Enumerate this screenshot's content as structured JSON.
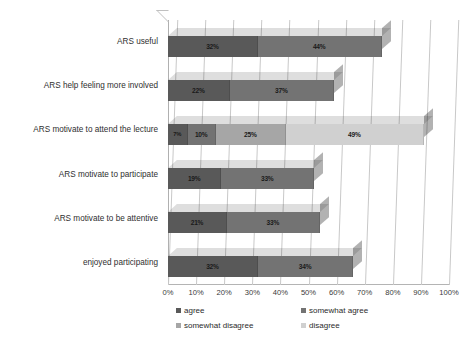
{
  "chart_data": {
    "type": "bar",
    "subtype": "horizontal-stacked-3d",
    "title": "",
    "xlabel": "",
    "ylabel": "",
    "xlim": [
      0,
      100
    ],
    "xtick_labels": [
      "0%",
      "10%",
      "20%",
      "30%",
      "40%",
      "50%",
      "60%",
      "70%",
      "80%",
      "90%",
      "100%"
    ],
    "xtick_values": [
      0,
      10,
      20,
      30,
      40,
      50,
      60,
      70,
      80,
      90,
      100
    ],
    "grid": true,
    "legend_position": "bottom",
    "categories": [
      "ARS useful",
      "ARS help feeling more involved",
      "ARS motivate to attend the lecture",
      "ARS motivate to participate",
      "ARS motivate to be attentive",
      "enjoyed participating"
    ],
    "series": [
      {
        "name": "agree",
        "color": "#595959",
        "values": [
          32,
          22,
          7,
          19,
          21,
          32
        ]
      },
      {
        "name": "somewhat agree",
        "color": "#737373",
        "values": [
          44,
          37,
          10,
          33,
          33,
          34
        ]
      },
      {
        "name": "somewhat disagree",
        "color": "#a6a6a6",
        "values": [
          0,
          0,
          25,
          0,
          0,
          0
        ]
      },
      {
        "name": "disagree",
        "color": "#d0d0d0",
        "values": [
          0,
          0,
          49,
          0,
          0,
          0
        ]
      }
    ],
    "bar_labels": [
      [
        "32%",
        "44%",
        "",
        ""
      ],
      [
        "22%",
        "37%",
        "",
        ""
      ],
      [
        "7%",
        "10%",
        "25%",
        "49%"
      ],
      [
        "19%",
        "33%",
        "",
        ""
      ],
      [
        "21%",
        "33%",
        "",
        ""
      ],
      [
        "32%",
        "34%",
        "",
        ""
      ]
    ]
  },
  "legend": {
    "items": [
      {
        "label": "agree",
        "color": "#595959"
      },
      {
        "label": "somewhat agree",
        "color": "#737373"
      },
      {
        "label": "somewhat disagree",
        "color": "#a6a6a6"
      },
      {
        "label": "disagree",
        "color": "#d0d0d0"
      }
    ]
  },
  "colors": {
    "background": "#ffffff",
    "gridline": "#c8c8c8",
    "axis": "#b0b0b0",
    "text": "#2b2b2b"
  }
}
